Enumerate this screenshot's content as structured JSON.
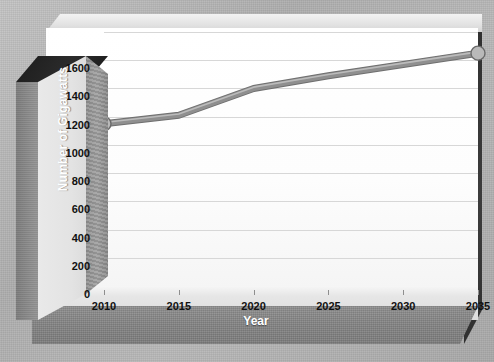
{
  "chart_data": {
    "type": "line",
    "title": "",
    "xlabel": "Year",
    "ylabel": "Number of Gigawatts",
    "x": [
      2010,
      2015,
      2020,
      2025,
      2030,
      2035
    ],
    "categories": [
      "2010",
      "2015",
      "2020",
      "2025",
      "2030",
      "2035"
    ],
    "values": [
      1150,
      1210,
      1400,
      1490,
      1570,
      1650
    ],
    "series": [
      {
        "name": "Number of Gigawatts",
        "values": [
          1150,
          1210,
          1400,
          1490,
          1570,
          1650
        ]
      }
    ],
    "xlim": [
      2010,
      2035
    ],
    "ylim": [
      0,
      1800
    ],
    "ytick_values": [
      0,
      200,
      400,
      600,
      800,
      1000,
      1200,
      1400,
      1600
    ],
    "ytick_labels": [
      "0",
      "200",
      "400",
      "600",
      "800",
      "1000",
      "1200",
      "1400",
      "1600"
    ],
    "xtick_labels": [
      "2010",
      "2015",
      "2020",
      "2025",
      "2030",
      "2035"
    ],
    "grid": "horizontal",
    "legend": "none",
    "markers": [
      "2010",
      "2035"
    ],
    "style": "3d-beveled",
    "colors": {
      "line": "#8f8f8f",
      "line_highlight": "#c9c9c9",
      "marker_fill": "#b9b9b9",
      "marker_stroke": "#6a6a6a",
      "gridline": "#d7d7d7",
      "plot_background": "#ffffff",
      "panel_shadow": "#3a3a3a",
      "axis_title_text": "#ffffff",
      "tick_text": "#111111",
      "page_background": "#b3b3b3"
    }
  },
  "axes": {
    "y_title": "Number of Gigawatts",
    "x_title": "Year"
  }
}
